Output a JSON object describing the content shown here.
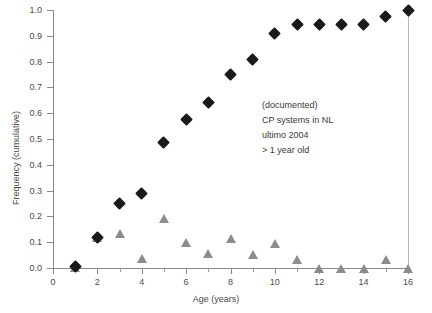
{
  "chart_data": {
    "type": "scatter",
    "title": "",
    "xlabel": "Age (years)",
    "ylabel": "Frequency (cumulative)",
    "xlim": [
      0,
      16
    ],
    "ylim": [
      0.0,
      1.0
    ],
    "grid": false,
    "legend_position": "none",
    "x": [
      1,
      2,
      3,
      4,
      5,
      6,
      7,
      8,
      9,
      10,
      11,
      12,
      13,
      14,
      15,
      16
    ],
    "series": [
      {
        "name": "cumulative frequency",
        "marker": "diamond",
        "color": "#1a1a1a",
        "values": [
          0.005,
          0.12,
          0.25,
          0.29,
          0.485,
          0.575,
          0.64,
          0.75,
          0.81,
          0.91,
          0.945,
          0.945,
          0.945,
          0.945,
          0.975,
          1.0
        ]
      },
      {
        "name": "frequency per year",
        "marker": "triangle",
        "color": "#8c8c8c",
        "values": [
          0.005,
          0.12,
          0.135,
          0.04,
          0.195,
          0.1,
          0.06,
          0.115,
          0.055,
          0.095,
          0.035,
          0.0,
          0.0,
          0.0,
          0.035,
          0.0
        ]
      }
    ],
    "x_ticks": [
      0,
      2,
      4,
      6,
      8,
      10,
      12,
      14,
      16
    ],
    "x_minor_ticks": [
      1,
      3,
      5,
      7,
      9,
      11,
      13,
      15
    ],
    "y_ticks": [
      "0.0",
      "0.1",
      "0.2",
      "0.3",
      "0.4",
      "0.5",
      "0.6",
      "0.7",
      "0.8",
      "0.9",
      "1.0"
    ],
    "annotations": [
      {
        "text": "(documented)"
      },
      {
        "text": "CP systems in NL"
      },
      {
        "text": "ultimo 2004"
      },
      {
        "text": "> 1 year old"
      }
    ],
    "vertical_reference_line": {
      "x": 16,
      "color": "#b9b9b9"
    }
  },
  "clipped_title": ""
}
